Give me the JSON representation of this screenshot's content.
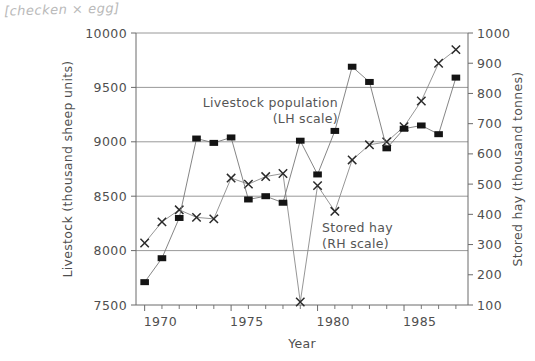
{
  "annotation": {
    "handwritten_note": "[checken × egg]"
  },
  "axes": {
    "left": {
      "title": "Livestock (thousand sheep units)",
      "ticks": [
        "7500",
        "8000",
        "8500",
        "9000",
        "9500",
        "10000"
      ]
    },
    "right": {
      "title": "Stored hay (thousand tonnes)",
      "ticks": [
        "100",
        "200",
        "300",
        "400",
        "500",
        "600",
        "700",
        "800",
        "900",
        "1000"
      ]
    },
    "bottom": {
      "title": "Year",
      "ticks": [
        "1970",
        "1975",
        "1980",
        "1985"
      ]
    }
  },
  "series_labels": {
    "livestock_line1": "Livestock population",
    "livestock_line2": "(LH scale)",
    "hay_line1": "Stored hay",
    "hay_line2": "(RH scale)"
  },
  "chart_data": {
    "type": "line",
    "title": "",
    "xlabel": "Year",
    "ylabel": "Livestock (thousand sheep units)",
    "y2label": "Stored hay (thousand tonnes)",
    "grid": true,
    "legend_position": "inside-plot",
    "x": [
      1970,
      1971,
      1972,
      1973,
      1974,
      1975,
      1976,
      1977,
      1978,
      1979,
      1980,
      1981,
      1982,
      1983,
      1984,
      1985,
      1986,
      1987,
      1988
    ],
    "xlim": [
      1969.5,
      1988.7
    ],
    "ylim": [
      7500,
      10000
    ],
    "y2lim": [
      100,
      1000
    ],
    "xticks_major": [
      1970,
      1975,
      1980,
      1985
    ],
    "yticks": [
      7500,
      8000,
      8500,
      9000,
      9500,
      10000
    ],
    "y2ticks": [
      100,
      200,
      300,
      400,
      500,
      600,
      700,
      800,
      900,
      1000
    ],
    "series": [
      {
        "name": "Livestock population (LH scale)",
        "axis": "left",
        "marker": "square",
        "color": "#141414",
        "units": "thousand sheep units",
        "values": [
          7710,
          7930,
          8300,
          9030,
          8990,
          9040,
          8470,
          8500,
          8440,
          9010,
          8700,
          9100,
          9690,
          9550,
          8940,
          9120,
          9150,
          9070,
          9590
        ]
      },
      {
        "name": "Stored hay (RH scale)",
        "axis": "right",
        "marker": "cross",
        "color": "#2b2b2b",
        "units": "thousand tonnes",
        "values": [
          305,
          375,
          415,
          390,
          385,
          520,
          500,
          525,
          535,
          110,
          495,
          410,
          580,
          630,
          640,
          690,
          775,
          900,
          945
        ]
      }
    ]
  }
}
